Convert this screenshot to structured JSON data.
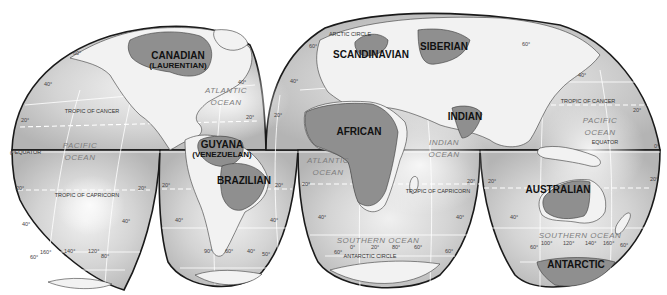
{
  "map": {
    "projection": "interrupted-homolosine",
    "colors": {
      "ocean": "#b8b8b8",
      "ocean_highlight": "#f4f4f4",
      "land": "#f2f2f2",
      "shield": "#8f8f8f",
      "outline": "#1a1a1a"
    },
    "shields": [
      {
        "name": "CANADIAN",
        "sub": "(LAURENTIAN)"
      },
      {
        "name": "GUYANA",
        "sub": "(VENEZUELAN)"
      },
      {
        "name": "BRAZILIAN"
      },
      {
        "name": "SCANDINAVIAN"
      },
      {
        "name": "SIBERIAN"
      },
      {
        "name": "AFRICAN"
      },
      {
        "name": "INDIAN"
      },
      {
        "name": "AUSTRALIAN"
      },
      {
        "name": "ANTARCTIC"
      }
    ],
    "oceans": [
      {
        "line1": "PACIFIC",
        "line2": "OCEAN"
      },
      {
        "line1": "ATLANTIC",
        "line2": "OCEAN"
      },
      {
        "line1": "ATLANTIC",
        "line2": "OCEAN"
      },
      {
        "line1": "INDIAN",
        "line2": "OCEAN"
      },
      {
        "line1": "PACIFIC",
        "line2": "OCEAN"
      },
      {
        "line1": "SOUTHERN OCEAN"
      },
      {
        "line1": "SOUTHERN OCEAN"
      }
    ],
    "reference_lines": {
      "tropic_cancer": "TROPIC OF CANCER",
      "tropic_capricorn": "TROPIC OF CAPRICORN",
      "equator": "EQUATOR",
      "arctic_circle": "ARCTIC CIRCLE",
      "antarctic_circle": "ANTARCTIC CIRCLE"
    },
    "latitude_labels": {
      "d0": "0°",
      "d20": "20°",
      "d40": "40°",
      "d60": "60°"
    },
    "longitude_labels": {
      "l160": "160°",
      "l140": "140°",
      "l120": "120°",
      "l80": "80°",
      "l90": "90°",
      "l60": "60°",
      "l40": "40°",
      "l50": "50°",
      "l0": "0°",
      "l20": "20°",
      "l100": "100°",
      "l120b": "120°",
      "l140b": "140°",
      "l160b": "160°",
      "l80b": "80°",
      "l60b": "60°"
    }
  }
}
